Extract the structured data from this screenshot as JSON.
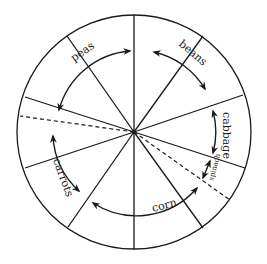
{
  "diagram": {
    "title": "",
    "type": "crop-rotation-wheel",
    "center": {
      "x": 134,
      "y": 132
    },
    "radius": 117,
    "stroke_color": "#1a1a1a",
    "crops": [
      {
        "id": "peas",
        "label": "peas"
      },
      {
        "id": "beans",
        "label": "beans"
      },
      {
        "id": "cabbage",
        "label": "cabbage"
      },
      {
        "id": "spinach",
        "label": "spinach"
      },
      {
        "id": "corn",
        "label": "corn"
      },
      {
        "id": "carrots",
        "label": "carrots"
      }
    ]
  }
}
